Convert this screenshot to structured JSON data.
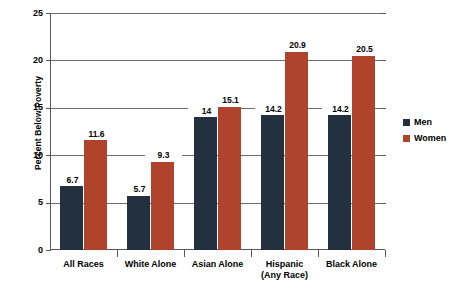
{
  "chart_data": {
    "type": "bar",
    "title": "",
    "xlabel": "",
    "ylabel": "Percent Below Poverty",
    "ylim": [
      0,
      25
    ],
    "yticks": [
      0,
      5,
      10,
      15,
      20,
      25
    ],
    "ytick_labels": [
      "0",
      "5",
      "10",
      "15",
      "20",
      "25"
    ],
    "grid": true,
    "legend_position": "right",
    "categories": [
      "All Races",
      "White Alone",
      "Asian Alone",
      "Hispanic\n(Any Race)",
      "Black Alone"
    ],
    "series": [
      {
        "name": "Men",
        "color": "#22303f",
        "values": [
          6.7,
          5.7,
          14,
          14.2,
          14.2
        ],
        "labels": [
          "6.7",
          "5.7",
          "14",
          "14.2",
          "14.2"
        ]
      },
      {
        "name": "Women",
        "color": "#b0432b",
        "values": [
          11.6,
          9.3,
          15.1,
          20.9,
          20.5
        ],
        "labels": [
          "11.6",
          "9.3",
          "15.1",
          "20.9",
          "20.5"
        ]
      }
    ]
  },
  "legend": {
    "items": [
      {
        "label": "Men",
        "color": "#22303f"
      },
      {
        "label": "Women",
        "color": "#b0432b"
      }
    ]
  },
  "axis": {
    "y_title": "Percent Below Poverty"
  }
}
